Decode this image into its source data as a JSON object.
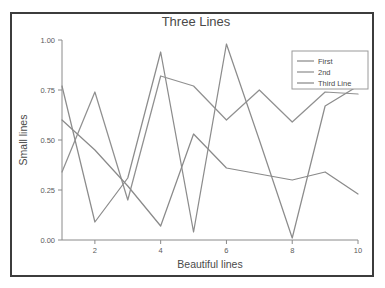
{
  "figure": {
    "background_color": "#ffffff",
    "frame_color": "#3c3c3c",
    "axis_color": "#8a8a8a"
  },
  "chart_data": {
    "type": "line",
    "title": "Three Lines",
    "xlabel": "Beautiful lines",
    "ylabel": "Small lines",
    "x": [
      1,
      2,
      3,
      4,
      5,
      6,
      7,
      8,
      9,
      10
    ],
    "xlim": [
      1,
      10
    ],
    "ylim": [
      0.0,
      1.0
    ],
    "xticks": [
      2,
      4,
      6,
      8,
      10
    ],
    "xtick_labels": [
      "2",
      "4",
      "6",
      "8",
      "10"
    ],
    "yticks": [
      0.0,
      0.25,
      0.5,
      0.75,
      1.0
    ],
    "ytick_labels": [
      "0.00",
      "0.25",
      "0.50",
      "0.75",
      "1.00"
    ],
    "grid": false,
    "legend_position": "upper right",
    "series": [
      {
        "name": "First",
        "color": "#8c8c8c",
        "values": [
          0.77,
          0.09,
          0.31,
          0.94,
          0.04,
          0.98,
          0.5,
          0.01,
          0.67,
          0.77
        ]
      },
      {
        "name": "2nd",
        "color": "#909090",
        "values": [
          0.34,
          0.74,
          0.2,
          0.82,
          0.77,
          0.6,
          0.75,
          0.59,
          0.74,
          0.73
        ]
      },
      {
        "name": "Third Line",
        "color": "#8a8a8a",
        "values": [
          0.6,
          0.45,
          0.27,
          0.07,
          0.53,
          0.36,
          0.33,
          0.3,
          0.34,
          0.23
        ]
      }
    ]
  },
  "legend": {
    "entries": [
      {
        "label": "First"
      },
      {
        "label": "2nd"
      },
      {
        "label": "Third Line"
      }
    ]
  }
}
